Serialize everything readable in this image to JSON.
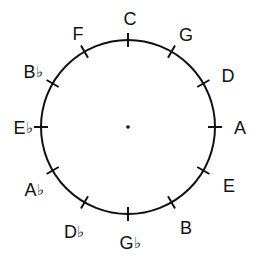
{
  "figure": {
    "background_color": "#ffffff",
    "ink_color": "#111111"
  },
  "chart_data": {
    "type": "diagram",
    "subtype": "circle-of-fifths",
    "center": {
      "x": 128,
      "y": 127,
      "marker": "dot"
    },
    "radius": 87,
    "grid": false,
    "legend": null,
    "tick_count": 12,
    "tick_interval_degrees": 30,
    "notes": [
      {
        "label": "C",
        "root": "C",
        "accidental": "",
        "angle_deg": 0,
        "position": "top",
        "label_x": 130,
        "label_y": 19,
        "tick": true
      },
      {
        "label": "G",
        "root": "G",
        "accidental": "",
        "angle_deg": 30,
        "position": "upper-right",
        "label_x": 186,
        "label_y": 35,
        "tick": true
      },
      {
        "label": "D",
        "root": "D",
        "accidental": "",
        "angle_deg": 60,
        "position": "right-upper",
        "label_x": 228,
        "label_y": 76,
        "tick": true
      },
      {
        "label": "A",
        "root": "A",
        "accidental": "",
        "angle_deg": 90,
        "position": "right",
        "label_x": 240,
        "label_y": 128,
        "tick": true
      },
      {
        "label": "E",
        "root": "E",
        "accidental": "",
        "angle_deg": 120,
        "position": "right-lower",
        "label_x": 229,
        "label_y": 186,
        "tick": true
      },
      {
        "label": "B",
        "root": "B",
        "accidental": "",
        "angle_deg": 150,
        "position": "lower-right",
        "label_x": 186,
        "label_y": 228,
        "tick": true
      },
      {
        "label": "G♭",
        "root": "G",
        "accidental": "♭",
        "angle_deg": 180,
        "position": "bottom",
        "label_x": 130,
        "label_y": 243,
        "tick": true
      },
      {
        "label": "D♭",
        "root": "D",
        "accidental": "♭",
        "angle_deg": 210,
        "position": "lower-left",
        "label_x": 74,
        "label_y": 232,
        "tick": true
      },
      {
        "label": "A♭",
        "root": "A",
        "accidental": "♭",
        "angle_deg": 240,
        "position": "left-lower",
        "label_x": 34,
        "label_y": 190,
        "tick": true
      },
      {
        "label": "E♭",
        "root": "E",
        "accidental": "♭",
        "angle_deg": 270,
        "position": "left",
        "label_x": 23,
        "label_y": 128,
        "tick": true
      },
      {
        "label": "B♭",
        "root": "B",
        "accidental": "♭",
        "angle_deg": 300,
        "position": "left-upper",
        "label_x": 33,
        "label_y": 72,
        "tick": true
      },
      {
        "label": "F",
        "root": "F",
        "accidental": "",
        "angle_deg": 330,
        "position": "upper-left",
        "label_x": 78,
        "label_y": 34,
        "tick": true
      }
    ]
  }
}
